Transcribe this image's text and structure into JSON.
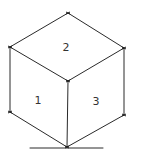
{
  "diagram": {
    "type": "isometric-cube-sketch",
    "faces": [
      {
        "id": "left",
        "label": "1"
      },
      {
        "id": "top",
        "label": "2"
      },
      {
        "id": "right",
        "label": "3"
      }
    ],
    "line_color": "#2a2a2a",
    "background": "#ffffff"
  }
}
